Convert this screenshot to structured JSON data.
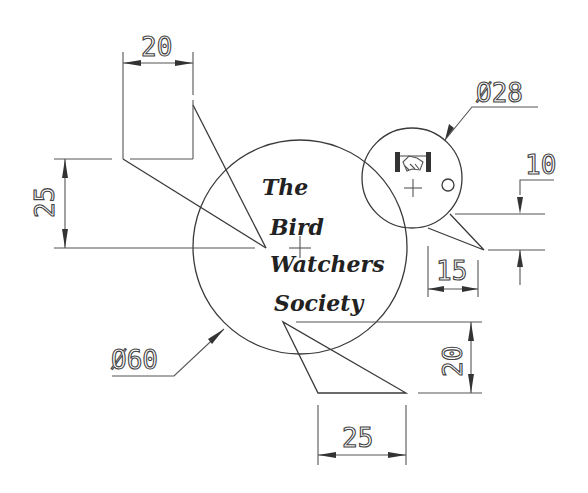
{
  "drawing": {
    "title_lines": [
      "The",
      "Bird",
      "Watchers",
      "Society"
    ],
    "dimensions": {
      "wing_width": "20",
      "wing_height": "25",
      "body_diameter": "Ø60",
      "head_diameter": "Ø28",
      "beak_offset": "10",
      "beak_length": "15",
      "tail_height": "20",
      "tail_width": "25"
    },
    "icons": {
      "logo": "handshake-icon",
      "eye": "eye-circle",
      "center_mark": "crosshair"
    },
    "colors": {
      "line": "#3a3a3a",
      "background": "#ffffff"
    }
  }
}
